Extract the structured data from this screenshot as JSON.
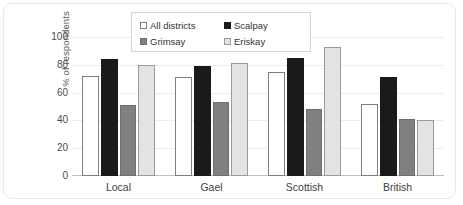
{
  "chart_data": {
    "type": "bar",
    "title": "",
    "xlabel": "",
    "ylabel": "% of respondents",
    "ylim": [
      0,
      100
    ],
    "yticks": [
      100,
      80,
      60,
      40,
      20,
      0
    ],
    "grid": true,
    "legend_position": "top-center",
    "categories": [
      "Local",
      "Gael",
      "Scottish",
      "British"
    ],
    "series": [
      {
        "name": "All districts",
        "color": "#ffffff",
        "values": [
          72,
          71,
          75,
          52
        ]
      },
      {
        "name": "Scalpay",
        "color": "#1a1a1a",
        "values": [
          84,
          79,
          85,
          71
        ]
      },
      {
        "name": "Grimsay",
        "color": "#808080",
        "values": [
          51,
          53,
          48,
          41
        ]
      },
      {
        "name": "Eriskay",
        "color": "#e3e3e3",
        "values": [
          80,
          81,
          93,
          40
        ]
      }
    ]
  }
}
